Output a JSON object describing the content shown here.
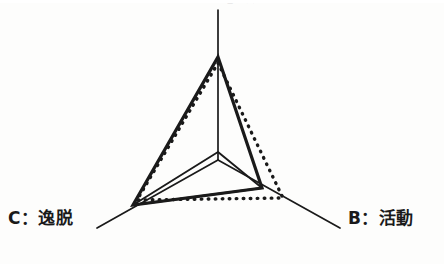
{
  "figure": {
    "title_cut_off": "A：意欲",
    "background_color": "#fdfdfc",
    "ink_color": "#1a1a1a"
  },
  "axes": {
    "a": {
      "key": "A",
      "separator": "：",
      "name": "意欲",
      "label": "A：意欲",
      "position": "top",
      "visible": "partially cropped at top edge"
    },
    "b": {
      "key": "B",
      "separator": "：",
      "name": "活動",
      "label": "B：活動",
      "position": "bottom-right"
    },
    "c": {
      "key": "C",
      "separator": "：",
      "name": "逸脱",
      "label": "C：逸脱",
      "position": "bottom-left"
    }
  },
  "chart_data": {
    "type": "line",
    "subtype": "radar",
    "title": "A：意欲",
    "xlabel": "",
    "ylabel": "",
    "categories": [
      "A：意欲",
      "B：活動",
      "C：逸脱"
    ],
    "axis_order": [
      "A",
      "B",
      "C"
    ],
    "axis_angles_deg": [
      90,
      330,
      210
    ],
    "rlim": [
      0,
      100
    ],
    "grid": true,
    "grid_rings": [
      28
    ],
    "legend": "none",
    "legend_position": "none",
    "series": [
      {
        "name": "solid",
        "style": "solid",
        "color": "#1a1a1a",
        "values": [
          100,
          58,
          76
        ]
      },
      {
        "name": "dotted",
        "style": "dotted",
        "color": "#1a1a1a",
        "values": [
          90,
          73,
          73
        ]
      }
    ],
    "annotations": []
  },
  "geometry": {
    "center": {
      "x": 218,
      "y": 160
    },
    "axis_a_tip": {
      "x": 218,
      "y": 10
    },
    "axis_b_tip": {
      "x": 340,
      "y": 228
    },
    "axis_c_tip": {
      "x": 97,
      "y": 228
    },
    "solid_polygon": [
      {
        "x": 218,
        "y": 57
      },
      {
        "x": 262,
        "y": 188
      },
      {
        "x": 133,
        "y": 205
      }
    ],
    "dotted_polygon": [
      {
        "x": 218,
        "y": 63
      },
      {
        "x": 283,
        "y": 198
      },
      {
        "x": 137,
        "y": 200
      }
    ],
    "inner_triangle": [
      {
        "x": 218,
        "y": 152
      },
      {
        "x": 262,
        "y": 188
      },
      {
        "x": 133,
        "y": 205
      }
    ]
  }
}
